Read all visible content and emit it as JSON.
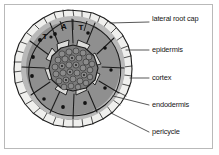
{
  "figure": {
    "type": "labeled-biological-diagram",
    "frame_color": "#b9b9b9",
    "background_color": "#ffffff"
  },
  "callouts": [
    {
      "id": "lateral-root-cap",
      "label": "lateral root cap",
      "text_x": 152,
      "text_y": 18,
      "line": {
        "x1": 110,
        "y1": 23,
        "x2": 149,
        "y2": 22
      }
    },
    {
      "id": "epidermis",
      "label": "epidermis",
      "text_x": 152,
      "text_y": 46,
      "line": {
        "x1": 126,
        "y1": 50,
        "x2": 149,
        "y2": 50
      }
    },
    {
      "id": "cortex",
      "label": "cortex",
      "text_x": 152,
      "text_y": 74,
      "line": {
        "x1": 130,
        "y1": 78,
        "x2": 149,
        "y2": 78
      }
    },
    {
      "id": "endodermis",
      "label": "endodermis",
      "text_x": 152,
      "text_y": 101,
      "line": {
        "x1": 113,
        "y1": 96,
        "x2": 149,
        "y2": 105
      }
    },
    {
      "id": "pericycle",
      "label": "pericycle",
      "text_x": 152,
      "text_y": 128,
      "line": {
        "x1": 111,
        "y1": 113,
        "x2": 149,
        "y2": 132
      }
    }
  ],
  "cell_letters": [
    {
      "label": "T",
      "x": 45,
      "y": 36
    },
    {
      "label": "A",
      "x": 64,
      "y": 26
    },
    {
      "label": "T",
      "x": 81,
      "y": 27
    }
  ],
  "colors": {
    "root_cap_cell": "#eeeeec",
    "epidermis_cell": "#b6b6b6",
    "cortex_cell": "#8f8f8f",
    "endodermis_cell": "#d8d8d6",
    "stele_fill": "#787878",
    "stele_cell": "#8a8a8a",
    "nucleus": "#111111",
    "outline": "#1a1a1a",
    "leader_line": "#3a3a3a",
    "label_text": "#151515"
  },
  "regions": {
    "lateral_root_cap": "outermost ring of pale irregular cells",
    "epidermis": "ring of mid-grey cells inside the root cap",
    "cortex": "large dark-grey cells with nuclei",
    "endodermis": "pale wedge cells ringing the stele",
    "pericycle": "layer just inside the endodermis",
    "stele": "central mass of small polygonal cells"
  }
}
